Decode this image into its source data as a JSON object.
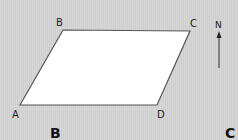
{
  "diagram": {
    "shape": "parallelogram",
    "vertices": [
      {
        "label": "A",
        "x": 20,
        "y": 105
      },
      {
        "label": "B",
        "x": 63,
        "y": 30
      },
      {
        "label": "C",
        "x": 190,
        "y": 31
      },
      {
        "label": "D",
        "x": 157,
        "y": 105
      }
    ],
    "fill_color": "#ffffff",
    "stroke_color": "#555555",
    "background_color": "#d3d3d3"
  },
  "labels": {
    "A": "A",
    "B": "B",
    "C": "C",
    "D": "D"
  },
  "compass": {
    "label": "N",
    "icon": "north-arrow-icon"
  },
  "panel_labels": {
    "left": "B",
    "right": "C"
  }
}
